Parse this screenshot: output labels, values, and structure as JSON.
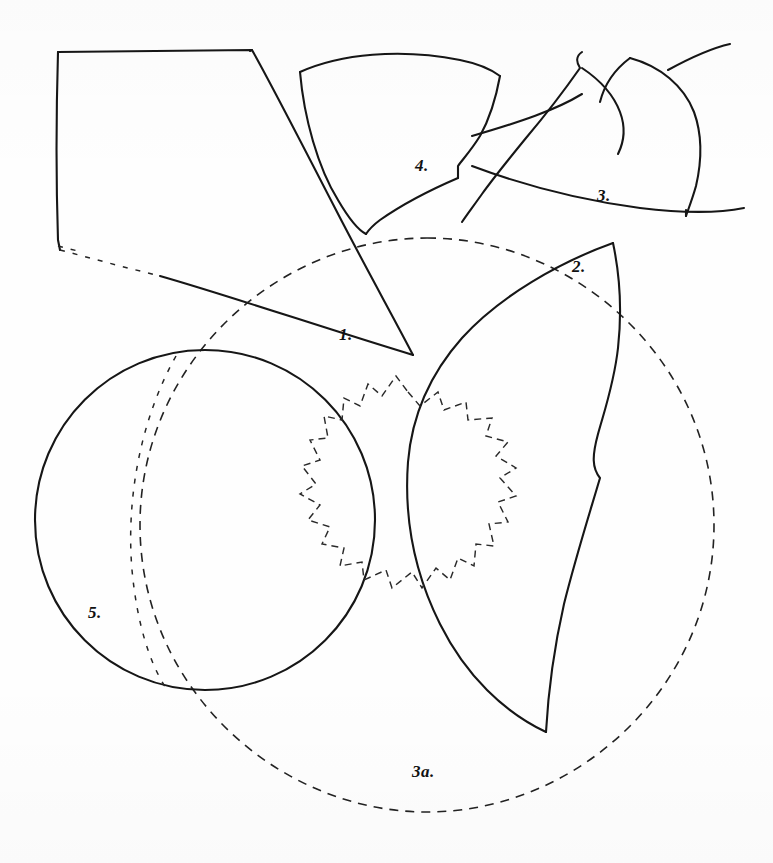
{
  "figure": {
    "medium": "pen-and-ink line drawing on white paper",
    "background_color": "#ffffff",
    "ink_color": "#161616",
    "canvas": {
      "width": 773,
      "height": 863
    }
  },
  "labels": [
    {
      "id": "label-1",
      "text": "1.",
      "x": 339,
      "y": 325,
      "refers_to": "triangular-wedge-plate"
    },
    {
      "id": "label-2",
      "text": "2.",
      "x": 572,
      "y": 257,
      "refers_to": "leaf-lens-profile"
    },
    {
      "id": "label-3",
      "text": "3.",
      "x": 597,
      "y": 186,
      "refers_to": "crescent-band-group"
    },
    {
      "id": "label-4",
      "text": "4.",
      "x": 415,
      "y": 156,
      "refers_to": "fan-wedge-plate"
    },
    {
      "id": "label-5",
      "text": "5.",
      "x": 88,
      "y": 603,
      "refers_to": "solid-circle"
    },
    {
      "id": "label-3a",
      "text": "3a.",
      "x": 412,
      "y": 762,
      "refers_to": "large-dashed-circle"
    }
  ],
  "shapes": [
    {
      "id": "quadrilateral-plate",
      "name": "quadrilateral-plate",
      "style": "solid",
      "description": "Large irregular quadrilateral at upper left, top edge nearly horizontal, left edge vertical, lower-left corner ending in a short dashed tail"
    },
    {
      "id": "triangular-wedge-plate",
      "name": "triangular-wedge-plate",
      "style": "solid",
      "label": "1.",
      "description": "Long narrow triangle descending to the right, apex near (413,355)"
    },
    {
      "id": "fan-wedge-plate",
      "name": "fan-wedge-plate",
      "style": "solid",
      "label": "4.",
      "description": "Fan / sector shaped plate with curved top edge, narrowing to a point at the bottom"
    },
    {
      "id": "crescent-band-group",
      "name": "crescent-band-group",
      "style": "solid",
      "label": "3.",
      "description": "Two nested crescent bands at upper right, stacked like overlapping petals above a long sweeping base curve"
    },
    {
      "id": "leaf-lens-profile",
      "name": "leaf-lens-profile",
      "style": "solid",
      "label": "2.",
      "description": "Large pointed leaf / lens outline, left concave arc and right ogee arc meeting at a sharp tip near (613,243)"
    },
    {
      "id": "solid-circle",
      "name": "solid-circle",
      "style": "solid",
      "label": "5.",
      "center": [
        205,
        520
      ],
      "radius": 170,
      "description": "Complete solid-line circle on the left, intersecting the large dashed circle"
    },
    {
      "id": "large-dashed-circle",
      "name": "large-dashed-circle",
      "style": "dashed",
      "label": "3a.",
      "center": [
        427,
        525
      ],
      "radius": 287,
      "description": "Large dashed construction circle enclosing most of the lower composition"
    },
    {
      "id": "dashed-star-rosette",
      "name": "dashed-star-rosette",
      "style": "dashed",
      "description": "Dashed scalloped star / rosette outline with about fourteen points, centred near (408,520), overlaid on circle 5 and leaf 2"
    },
    {
      "id": "faint-dashed-chord",
      "name": "faint-dashed-chord",
      "style": "dashed",
      "description": "Faint dashed chord running vertically through the left circle"
    }
  ],
  "legend": {
    "solid_line_meaning": "preserved / measured outline",
    "dashed_line_meaning": "reconstructed / projected outline"
  }
}
